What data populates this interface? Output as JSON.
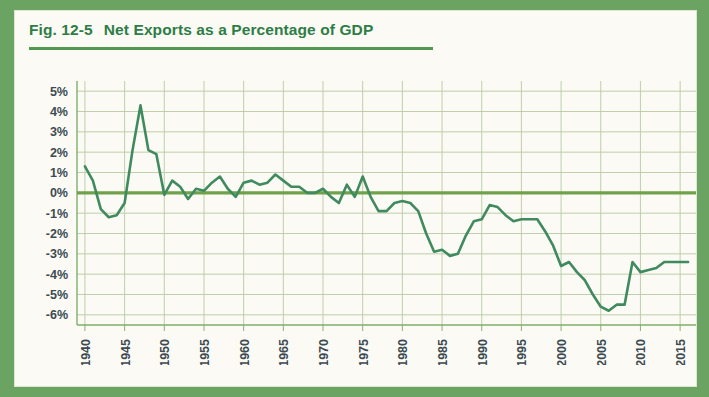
{
  "figure": {
    "number_label": "Fig. 12-5",
    "title": "Net Exports as a Percentage of GDP",
    "accent_color": "#2e7d47",
    "frame_color": "#6aa362",
    "card_color": "#fbfaf4"
  },
  "chart_data": {
    "type": "line",
    "title": "Net Exports as a Percentage of GDP",
    "xlabel": "",
    "ylabel": "",
    "xlim": [
      1939,
      2017
    ],
    "ylim": [
      -6.5,
      5.5
    ],
    "yticks": [
      5,
      4,
      3,
      2,
      1,
      0,
      -1,
      -2,
      -3,
      -4,
      -5,
      -6
    ],
    "ytick_labels": [
      "5%",
      "4%",
      "3%",
      "2%",
      "1%",
      "0%",
      "-1%",
      "-2%",
      "-3%",
      "-4%",
      "-5%",
      "-6%"
    ],
    "xticks": [
      1940,
      1945,
      1950,
      1955,
      1960,
      1965,
      1970,
      1975,
      1980,
      1985,
      1990,
      1995,
      2000,
      2005,
      2010,
      2015
    ],
    "xtick_labels": [
      "1940",
      "1945",
      "1950",
      "1955",
      "1960",
      "1965",
      "1970",
      "1975",
      "1980",
      "1985",
      "1990",
      "1995",
      "2000",
      "2005",
      "2010",
      "2015"
    ],
    "grid": true,
    "legend": null,
    "zero_reference_line": 0,
    "series": [
      {
        "name": "Net exports as a percentage of GDP",
        "color": "#3f8a5e",
        "x": [
          1940,
          1941,
          1942,
          1943,
          1944,
          1945,
          1946,
          1947,
          1948,
          1949,
          1950,
          1951,
          1952,
          1953,
          1954,
          1955,
          1956,
          1957,
          1958,
          1959,
          1960,
          1961,
          1962,
          1963,
          1964,
          1965,
          1966,
          1967,
          1968,
          1969,
          1970,
          1971,
          1972,
          1973,
          1974,
          1975,
          1976,
          1977,
          1978,
          1979,
          1980,
          1981,
          1982,
          1983,
          1984,
          1985,
          1986,
          1987,
          1988,
          1989,
          1990,
          1991,
          1992,
          1993,
          1994,
          1995,
          1996,
          1997,
          1998,
          1999,
          2000,
          2001,
          2002,
          2003,
          2004,
          2005,
          2006,
          2007,
          2008,
          2009,
          2010,
          2011,
          2012,
          2013,
          2014,
          2015,
          2016
        ],
        "y": [
          1.3,
          0.6,
          -0.8,
          -1.2,
          -1.1,
          -0.5,
          2.1,
          4.3,
          2.1,
          1.9,
          -0.1,
          0.6,
          0.3,
          -0.3,
          0.2,
          0.1,
          0.5,
          0.8,
          0.2,
          -0.2,
          0.5,
          0.6,
          0.4,
          0.5,
          0.9,
          0.6,
          0.3,
          0.3,
          0.0,
          0.0,
          0.2,
          -0.2,
          -0.5,
          0.4,
          -0.2,
          0.8,
          -0.2,
          -0.9,
          -0.9,
          -0.5,
          -0.4,
          -0.5,
          -0.9,
          -2.0,
          -2.9,
          -2.8,
          -3.1,
          -3.0,
          -2.1,
          -1.4,
          -1.3,
          -0.6,
          -0.7,
          -1.1,
          -1.4,
          -1.3,
          -1.3,
          -1.3,
          -1.9,
          -2.6,
          -3.6,
          -3.4,
          -3.9,
          -4.3,
          -5.0,
          -5.6,
          -5.8,
          -5.5,
          -5.5,
          -3.4,
          -3.9,
          -3.8,
          -3.7,
          -3.4,
          -3.4,
          -3.4,
          -3.4
        ]
      }
    ]
  }
}
